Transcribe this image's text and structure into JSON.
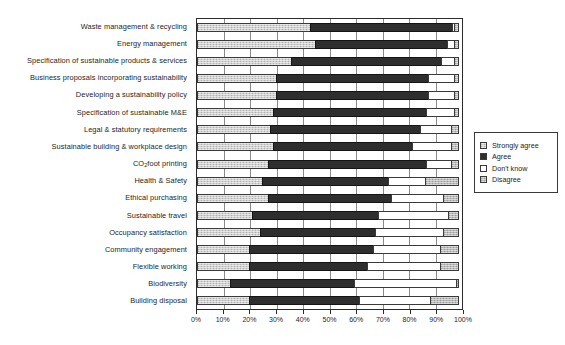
{
  "chart_data": {
    "type": "bar",
    "subtype": "stacked-horizontal-100",
    "title": "",
    "xlabel": "",
    "ylabel": "",
    "xlim": [
      0,
      100
    ],
    "xunit": "%",
    "grid": true,
    "legend_position": "right",
    "xticks": [
      "0%",
      "10%",
      "20%",
      "30%",
      "40%",
      "50%",
      "60%",
      "70%",
      "80%",
      "90%",
      "100%"
    ],
    "xtick_values": [
      0,
      10,
      20,
      30,
      40,
      50,
      60,
      70,
      80,
      90,
      100
    ],
    "legend": [
      {
        "label": "Strongly agree",
        "swatch": "light-hatch",
        "color": "#cfcfcf"
      },
      {
        "label": "Agree",
        "swatch": "solid-dark",
        "color": "#2e2e2e"
      },
      {
        "label": "Don't know",
        "swatch": "white",
        "color": "#ffffff"
      },
      {
        "label": "Disagree",
        "swatch": "gray-hatch",
        "color": "#b9b9b9"
      }
    ],
    "categories": [
      "Waste management & recycling",
      "Energy management",
      "Specification of sustainable products & services",
      "Business proposals incorporating sustainability",
      "Developing a sustainability policy",
      "Specification of sustainable M&E",
      "Legal & statutory requirements",
      "Sustainable building & workplace design",
      "CO2 foot printing",
      "Health & Safety",
      "Ethical purchasing",
      "Sustainable travel",
      "Occupancy satisfaction",
      "Community engagement",
      "Flexible working",
      "Biodiversity",
      "Building disposal"
    ],
    "series": [
      {
        "name": "Strongly agree",
        "values": [
          43,
          45,
          36,
          30,
          30,
          29,
          28,
          29,
          27,
          25,
          27,
          21,
          24,
          20,
          20,
          13,
          20
        ]
      },
      {
        "name": "Agree",
        "values": [
          54,
          50,
          57,
          58,
          58,
          58,
          57,
          53,
          60,
          48,
          47,
          48,
          44,
          47,
          45,
          47,
          42
        ]
      },
      {
        "name": "Don't know",
        "values": [
          1,
          3,
          5,
          10,
          10,
          11,
          12,
          15,
          10,
          14,
          20,
          27,
          26,
          26,
          28,
          39,
          27
        ]
      },
      {
        "name": "Disagree",
        "values": [
          2,
          2,
          2,
          2,
          2,
          2,
          3,
          3,
          3,
          13,
          6,
          4,
          6,
          7,
          7,
          1,
          11
        ]
      }
    ],
    "category_labels_html": [
      "Waste management &amp; recycling",
      "Energy management",
      "Specification of sustainable products &amp; services",
      "Business proposals incorporating sustainability",
      "Developing a sustainability policy",
      "Specification of sustainable M&amp;E",
      "Legal &amp; statutory requirements",
      "Sustainable building &amp; workplace design",
      "CO<sub>2</sub> foot printing",
      "Health &amp; Safety",
      "Ethical purchasing",
      "Sustainable travel",
      "Occupancy satisfaction",
      "Community engagement",
      "Flexible working",
      "Biodiversity",
      "Building disposal"
    ]
  }
}
